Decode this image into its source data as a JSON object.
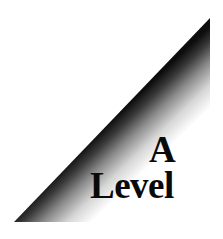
{
  "graphic": {
    "shape": "right-triangle",
    "points": [
      [
        14,
        222
      ],
      [
        210,
        18
      ],
      [
        210,
        222
      ]
    ],
    "gradient": {
      "edge_color": "#111111",
      "fade_color": "#ffffff"
    }
  },
  "text": {
    "line1": "A",
    "line2": "Level"
  }
}
